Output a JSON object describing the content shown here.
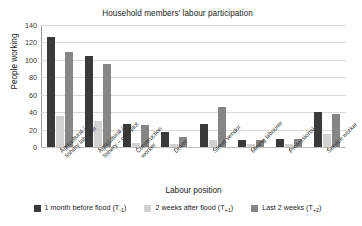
{
  "chart_data": {
    "type": "bar",
    "title": "Household members' labour participation",
    "xlabel": "Labour position",
    "ylabel": "People working",
    "ylim": [
      0,
      140
    ],
    "yticks": [
      0,
      20,
      40,
      60,
      80,
      100,
      120,
      140
    ],
    "grid": true,
    "legend_position": "bottom",
    "categories": [
      "Agricultural /\nfishery labourer",
      "Agricultural /\nfishery – own plot",
      "Construction\nworker",
      "Driver",
      "Street vendor",
      "Mining labourer",
      "Professional",
      "Service worker"
    ],
    "series": [
      {
        "name": "1 month before flood (T-1)",
        "label_main": "1 month before flood (T",
        "label_sub": "-1",
        "label_tail": ")",
        "color": "#3a3a3a",
        "values": [
          126,
          105,
          26,
          17,
          26,
          8,
          9,
          40
        ]
      },
      {
        "name": "2 weeks after flood (T+1)",
        "label_main": "2 weeks after flood (T",
        "label_sub": "+1",
        "label_tail": ")",
        "color": "#d2d2d2",
        "values": [
          36,
          30,
          5,
          3,
          8,
          4,
          4,
          15
        ]
      },
      {
        "name": "Last 2 weeks (T+2)",
        "label_main": "Last 2 weeks (T",
        "label_sub": "+2",
        "label_tail": ")",
        "color": "#868686",
        "values": [
          109,
          95,
          25,
          12,
          46,
          8,
          9,
          38
        ]
      }
    ]
  }
}
